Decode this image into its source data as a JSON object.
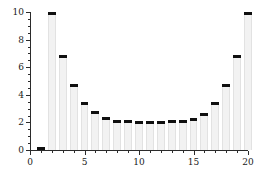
{
  "chart_data": {
    "type": "bar",
    "title": "",
    "subtitle": "",
    "xlabel": "",
    "ylabel": "",
    "xlim": [
      0,
      20
    ],
    "ylim": [
      0,
      10
    ],
    "grid": false,
    "legend": null,
    "categories": [
      1,
      2,
      3,
      4,
      5,
      6,
      7,
      8,
      9,
      10,
      11,
      12,
      13,
      14,
      15,
      16,
      17,
      18,
      19,
      20
    ],
    "values": [
      0.1,
      10.0,
      6.8,
      4.7,
      3.4,
      2.7,
      2.3,
      2.1,
      2.05,
      2.0,
      2.0,
      2.0,
      2.05,
      2.1,
      2.2,
      2.6,
      3.4,
      4.7,
      6.8,
      9.9
    ],
    "series": [
      {
        "name": "values",
        "values": [
          0.1,
          10.0,
          6.8,
          4.7,
          3.4,
          2.7,
          2.3,
          2.1,
          2.05,
          2.0,
          2.0,
          2.0,
          2.05,
          2.1,
          2.2,
          2.6,
          3.4,
          4.7,
          6.8,
          9.9
        ]
      }
    ],
    "x_ticks_major": [
      0,
      5,
      10,
      15,
      20
    ],
    "x_tick_labels": [
      "0",
      "5",
      "10",
      "15",
      "20"
    ],
    "x_ticks_minor_step": 1,
    "y_ticks_major": [
      0,
      2,
      4,
      6,
      8,
      10
    ],
    "y_tick_labels": [
      "0",
      "2",
      "4",
      "6",
      "8",
      "10"
    ],
    "y_ticks_minor_step": 0.5,
    "bar_width": 0.72,
    "colors": {
      "bar_fill": "#f2f2f2",
      "bar_edge": "#e2e2e2",
      "bar_cap": "#101010",
      "axis": "#2b2b2b",
      "text": "#1a1a1a",
      "background": "#ffffff"
    }
  }
}
